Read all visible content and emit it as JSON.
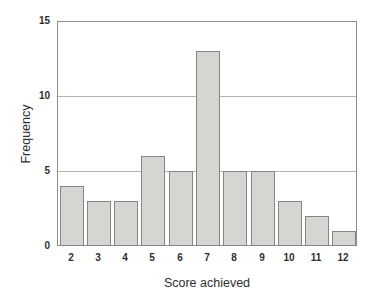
{
  "chart_data": {
    "type": "bar",
    "categories": [
      "2",
      "3",
      "4",
      "5",
      "6",
      "7",
      "8",
      "9",
      "10",
      "11",
      "12"
    ],
    "values": [
      4,
      3,
      3,
      6,
      5,
      13,
      5,
      5,
      3,
      2,
      1
    ],
    "title": "",
    "xlabel": "Score achieved",
    "ylabel": "Frequency",
    "ylim": [
      0,
      15
    ],
    "yticks": [
      0,
      5,
      10,
      15
    ],
    "grid": true,
    "legend": "none",
    "colors": {
      "bar_fill": "#d4d6d2",
      "bar_border": "#858585",
      "axis_box": "#8c8c8c",
      "gridline": "#b3b3b3",
      "text": "#2e2e2e",
      "background": "#ffffff"
    }
  }
}
